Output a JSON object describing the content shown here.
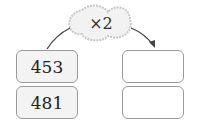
{
  "operation": {
    "label": "×2"
  },
  "inputs": [
    {
      "value": "453"
    },
    {
      "value": "481"
    }
  ],
  "outputs": [
    {
      "value": ""
    },
    {
      "value": ""
    }
  ]
}
